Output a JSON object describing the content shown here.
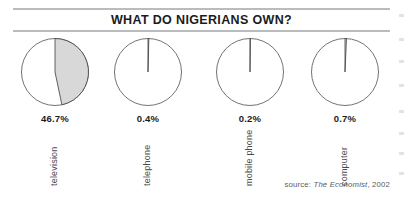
{
  "chart_data": {
    "type": "pie",
    "title": "WHAT DO NIGERIANS OWN?",
    "xlabel": "",
    "ylabel": "",
    "grid": false,
    "legend": "none",
    "note": "Four separate single-slice pie charts; each shaded wedge starts at 12 o'clock and sweeps clockwise by the stated percentage of households.",
    "categories": [
      "television",
      "telephone",
      "mobile phone",
      "computer"
    ],
    "values": [
      46.7,
      0.4,
      0.2,
      0.7
    ],
    "value_labels": [
      "46.7%",
      "0.4%",
      "0.2%",
      "0.7%"
    ],
    "source": "source: The Economist, 2002",
    "source_prefix": "source: ",
    "source_publication": "The Economist",
    "source_suffix": ", 2002",
    "series": [
      {
        "name": "share of Nigerians owning item",
        "values": [
          46.7,
          0.4,
          0.2,
          0.7
        ]
      }
    ],
    "slices": [
      {
        "category": "television",
        "value": 46.7,
        "label": "46.7%",
        "remainder": 53.3
      },
      {
        "category": "telephone",
        "value": 0.4,
        "label": "0.4%",
        "remainder": 99.6
      },
      {
        "category": "mobile phone",
        "value": 0.2,
        "label": "0.2%",
        "remainder": 99.8
      },
      {
        "category": "computer",
        "value": 0.7,
        "label": "0.7%",
        "remainder": 99.3
      }
    ]
  },
  "style": {
    "slice_fill": "#d8d8d8",
    "slice_stroke": "#3c3c3c",
    "pie_stroke": "#5a5a5a",
    "pie_background": "#ffffff",
    "rule_color": "#b9bcbe",
    "title_color": "#1b1b1b",
    "label_color": "#4a4a4a",
    "source_color": "#5b5b5b",
    "page_background": "#ffffff"
  }
}
